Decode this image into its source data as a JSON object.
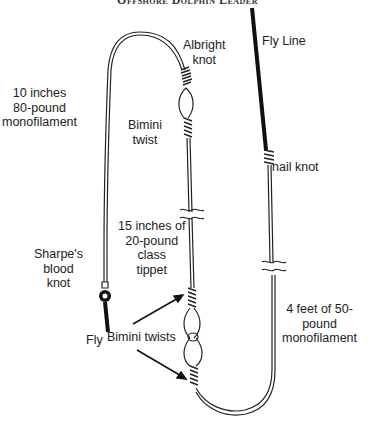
{
  "title": "Offshore Dolphin Leader",
  "labels": {
    "fly_line": "Fly Line",
    "albright_knot": "Albright\nknot",
    "shock_tippet": "10 inches\n80-pound\nmonofilament",
    "bimini_twist": "Bimini\ntwist",
    "nail_knot": "nail knot",
    "class_tippet": "15 inches of\n20-pound\nclass\ntippet",
    "sharpes_knot": "Sharpe's\nblood\nknot",
    "fly": "Fly",
    "bimini_twists": "Bimini twists",
    "butt_section": "4 feet of 50-\npound\nmonofilament"
  },
  "colors": {
    "line": "#222222",
    "fly_line": "#111111",
    "background": "#ffffff"
  }
}
